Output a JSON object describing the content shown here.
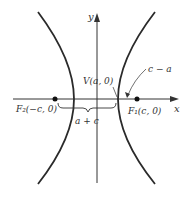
{
  "diagram": {
    "type": "hyperbola",
    "colors": {
      "curve": "#2a2a2a",
      "axis": "#333333",
      "text": "#333333",
      "background": "#ffffff"
    },
    "axes": {
      "x_label": "x",
      "y_label": "y"
    },
    "foci": [
      {
        "id": "F2",
        "label": "F₂(−c, 0)"
      },
      {
        "id": "F1",
        "label": "F₁(c, 0)"
      }
    ],
    "vertex": {
      "label": "V(a, 0)"
    },
    "annotations": {
      "distance_focus_to_vertex": "c − a",
      "distance_left_focus_to_vertex": "a + c"
    }
  }
}
